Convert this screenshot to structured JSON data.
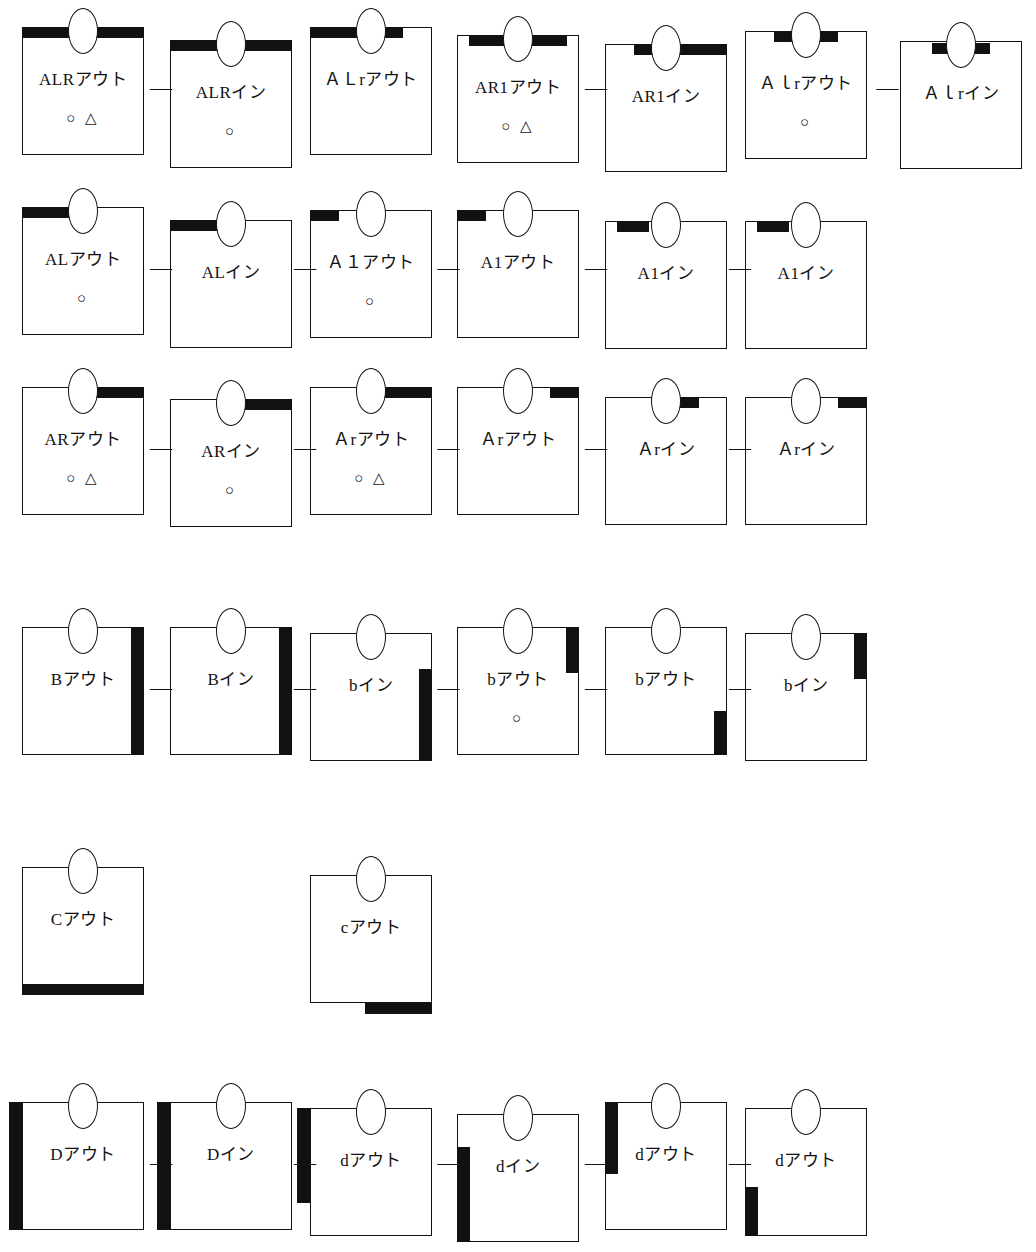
{
  "figure": {
    "kind": "technical-line-diagram",
    "separator_symbol": "—",
    "marker_circle": "○",
    "marker_triangle": "△",
    "colors": {
      "ink": "#111111",
      "paper": "#ffffff",
      "bar_fill": "#111111"
    }
  },
  "rows": [
    {
      "id": "row-1",
      "cells": [
        {
          "label": "ALRアウト",
          "marks": "○ △",
          "bar": "top-full"
        },
        {
          "label": "ALRイン",
          "marks": "○",
          "bar": "top-full"
        },
        {
          "label": "ＡＬrアウト",
          "marks": "",
          "bar": "top-left-75"
        },
        {
          "label": "AR1アウト",
          "marks": "○ △",
          "bar": "top-center-wide"
        },
        {
          "label": "AR1イン",
          "marks": "",
          "bar": "top-right-75"
        },
        {
          "label": "Ａｌrアウト",
          "marks": "○",
          "bar": "top-center-mid"
        },
        {
          "label": "Ａｌrイン",
          "marks": "",
          "bar": "top-center-short"
        }
      ],
      "separators": [
        0,
        3,
        5
      ]
    },
    {
      "id": "row-2",
      "cells": [
        {
          "label": "ALアウト",
          "marks": "○",
          "bar": "top-left-45"
        },
        {
          "label": "ALイン",
          "marks": "",
          "bar": "top-left-45"
        },
        {
          "label": "Ａ１アウト",
          "marks": "○",
          "bar": "top-left-22"
        },
        {
          "label": "A1アウト",
          "marks": "",
          "bar": "top-left-22"
        },
        {
          "label": "A1イン",
          "marks": "",
          "bar": "top-left-in-30"
        },
        {
          "label": "A1イン",
          "marks": "",
          "bar": "top-left-in-30"
        }
      ],
      "separators": [
        0,
        1,
        2,
        3,
        4
      ]
    },
    {
      "id": "row-3",
      "cells": [
        {
          "label": "ARアウト",
          "marks": "○ △",
          "bar": "top-right-50"
        },
        {
          "label": "ARイン",
          "marks": "○",
          "bar": "top-right-50"
        },
        {
          "label": "Ａrアウト",
          "marks": "○ △",
          "bar": "top-right-50"
        },
        {
          "label": "Ａrアウト",
          "marks": "",
          "bar": "top-right-22"
        },
        {
          "label": "Ａrイン",
          "marks": "",
          "bar": "top-right-in-22"
        },
        {
          "label": "Ａrイン",
          "marks": "",
          "bar": "top-right-22"
        }
      ],
      "separators": [
        0,
        1,
        2,
        3,
        4
      ]
    },
    {
      "id": "row-4",
      "cells": [
        {
          "label": "Bアウト",
          "marks": "",
          "bar": "right-full"
        },
        {
          "label": "Bイン",
          "marks": "",
          "bar": "right-full"
        },
        {
          "label": "bイン",
          "marks": "",
          "bar": "right-lower-70"
        },
        {
          "label": "bアウト",
          "marks": "○",
          "bar": "right-upper-35"
        },
        {
          "label": "bアウト",
          "marks": "",
          "bar": "right-bottom-30"
        },
        {
          "label": "bイン",
          "marks": "",
          "bar": "right-upper-35"
        }
      ],
      "separators": [
        0,
        1,
        2,
        3,
        4
      ]
    },
    {
      "id": "row-5",
      "cells": [
        {
          "label": "Cアウト",
          "marks": "",
          "bar": "bottom-full"
        },
        {
          "label": "cアウト",
          "marks": "",
          "bar": "bottom-outside-right"
        }
      ],
      "separators": []
    },
    {
      "id": "row-6",
      "cells": [
        {
          "label": "Dアウト",
          "marks": "",
          "bar": "left-full-outside"
        },
        {
          "label": "Dイン",
          "marks": "",
          "bar": "left-full-outside"
        },
        {
          "label": "dアウト",
          "marks": "",
          "bar": "left-upper-outside"
        },
        {
          "label": "dイン",
          "marks": "",
          "bar": "left-lower-inside"
        },
        {
          "label": "dアウト",
          "marks": "",
          "bar": "left-upper-inside"
        },
        {
          "label": "dアウト",
          "marks": "",
          "bar": "left-bottom-inside"
        }
      ],
      "separators": [
        0,
        1,
        2,
        3,
        4
      ]
    }
  ]
}
